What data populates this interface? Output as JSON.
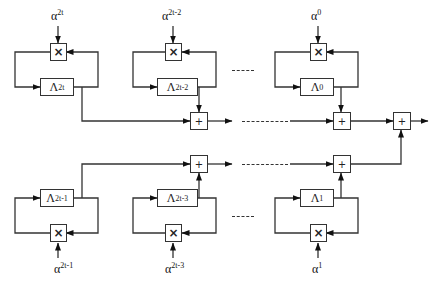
{
  "diagram": {
    "type": "block-diagram",
    "colors": {
      "stroke": "#333333",
      "background": "#ffffff",
      "text": "#111111"
    },
    "symbols": {
      "multiply": "×",
      "add": "+",
      "ellipsis": "----"
    },
    "top_row": [
      {
        "id": "t1",
        "alpha_base": "α",
        "alpha_exp": "2t",
        "reg_base": "Λ",
        "reg_sub": "2t"
      },
      {
        "id": "t2",
        "alpha_base": "α",
        "alpha_exp": "2t-2",
        "reg_base": "Λ",
        "reg_sub": "2t-2"
      },
      {
        "id": "t3",
        "alpha_base": "α",
        "alpha_exp": "0",
        "reg_base": "Λ",
        "reg_sub": "0"
      }
    ],
    "bottom_row": [
      {
        "id": "b1",
        "alpha_base": "α",
        "alpha_exp": "2t-1",
        "reg_base": "Λ",
        "reg_sub": "2t-1"
      },
      {
        "id": "b2",
        "alpha_base": "α",
        "alpha_exp": "2t-3",
        "reg_base": "Λ",
        "reg_sub": "2t-3"
      },
      {
        "id": "b3",
        "alpha_base": "α",
        "alpha_exp": "1",
        "reg_base": "Λ",
        "reg_sub": "1"
      }
    ]
  }
}
